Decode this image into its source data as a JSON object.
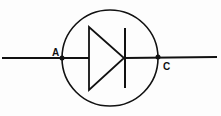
{
  "diagram": {
    "type": "circuit-symbol",
    "symbol": "diode",
    "labels": {
      "anode": "A",
      "cathode": "C"
    },
    "colors": {
      "stroke": "#111111",
      "background": "#fdfdfd"
    }
  }
}
